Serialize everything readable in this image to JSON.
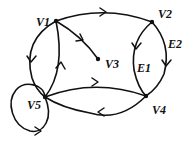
{
  "diagram": {
    "type": "directed-graph",
    "vertices": [
      {
        "id": "V1",
        "label": "V1"
      },
      {
        "id": "V2",
        "label": "V2"
      },
      {
        "id": "V3",
        "label": "V3"
      },
      {
        "id": "V4",
        "label": "V4"
      },
      {
        "id": "V5",
        "label": "V5"
      }
    ],
    "edges": [
      {
        "from": "V1",
        "to": "V2",
        "label": ""
      },
      {
        "from": "V1",
        "to": "V3",
        "label": ""
      },
      {
        "from": "V1",
        "to": "V5",
        "label": ""
      },
      {
        "from": "V5",
        "to": "V1",
        "label": ""
      },
      {
        "from": "V2",
        "to": "V4",
        "label": "E1"
      },
      {
        "from": "V2",
        "to": "V4",
        "label": "E2"
      },
      {
        "from": "V5",
        "to": "V4",
        "label": ""
      },
      {
        "from": "V4",
        "to": "V5",
        "label": ""
      },
      {
        "from": "V5",
        "to": "V5",
        "label": ""
      }
    ],
    "edge_labels": {
      "e1": "E1",
      "e2": "E2"
    },
    "colors": {
      "stroke": "#111111",
      "background": "#ffffff"
    }
  }
}
